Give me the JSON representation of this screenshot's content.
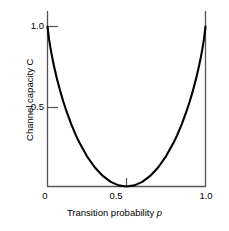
{
  "chart_data": {
    "type": "line",
    "title": "",
    "xlabel": "Transition probability p",
    "ylabel": "Channel capacity C",
    "xlim": [
      0,
      1
    ],
    "ylim": [
      0,
      1
    ],
    "grid": false,
    "legend": "none",
    "xticks": [
      0,
      0.5,
      1
    ],
    "xtick_labels": [
      "0",
      "0.5",
      "1.0"
    ],
    "yticks": [
      0.5,
      1
    ],
    "ytick_labels": [
      "0.5",
      "1.0"
    ],
    "series": [
      {
        "name": "C = 1 - H(p)",
        "x": [
          0.0,
          0.01,
          0.02,
          0.03,
          0.04,
          0.05,
          0.06,
          0.08,
          0.1,
          0.12,
          0.15,
          0.18,
          0.2,
          0.25,
          0.3,
          0.35,
          0.4,
          0.45,
          0.5,
          0.55,
          0.6,
          0.65,
          0.7,
          0.75,
          0.8,
          0.82,
          0.85,
          0.88,
          0.9,
          0.92,
          0.94,
          0.95,
          0.96,
          0.97,
          0.98,
          0.99,
          1.0
        ],
        "values": [
          1.0,
          0.9192,
          0.8586,
          0.8056,
          0.7577,
          0.7136,
          0.6726,
          0.5978,
          0.531,
          0.4705,
          0.3901,
          0.3194,
          0.2781,
          0.1887,
          0.1187,
          0.0659,
          0.029,
          0.0072,
          0.0,
          0.0072,
          0.029,
          0.0659,
          0.1187,
          0.1887,
          0.2781,
          0.3194,
          0.3901,
          0.4705,
          0.531,
          0.5978,
          0.6726,
          0.7136,
          0.7577,
          0.8056,
          0.8586,
          0.9192,
          1.0
        ]
      }
    ]
  },
  "axes": {
    "y_title": "Channel capacity C",
    "x_title_prefix": "Transition probability ",
    "x_title_variable": "p",
    "y_tick_1": "1.0",
    "y_tick_05": "0.5",
    "x_tick_0": "0",
    "x_tick_05": "0.5",
    "x_tick_1": "1.0"
  },
  "style": {
    "background": "#ffffff",
    "axis_color": "#555555",
    "curve_color": "#000000",
    "text_color": "#000000"
  }
}
